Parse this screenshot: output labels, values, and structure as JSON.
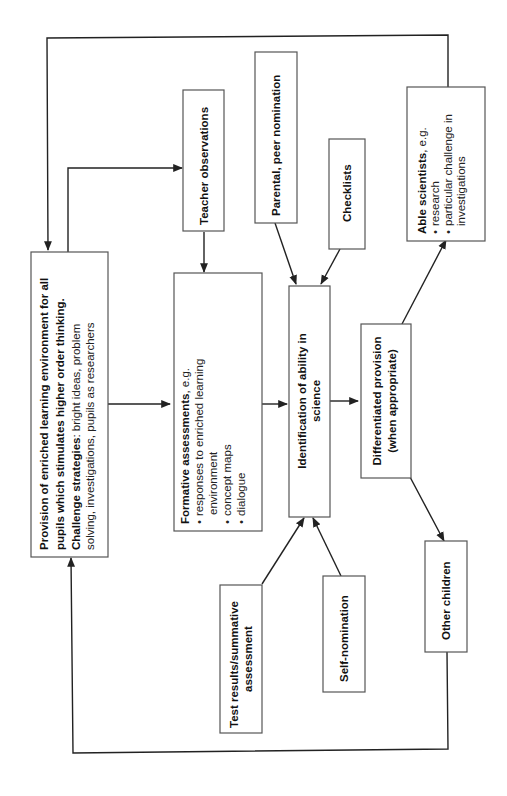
{
  "diagram": {
    "orientation": "rotated-90-ccw",
    "nodes": {
      "provision": {
        "line1": "Provision of enriched learning environment for all",
        "line2": "pupils which stimulates higher order thinking.",
        "line3_bold": "Challenge strategies",
        "line3_rest": ": bright ideas, problem",
        "line4": "solving, investigations, pupils as researchers"
      },
      "teacher_observations": {
        "label": "Teacher observations"
      },
      "formative": {
        "title_bold": "Formative assessments",
        "title_rest": ", e.g.",
        "bullets": [
          "responses to enriched learning",
          "environment",
          "concept maps",
          "dialogue"
        ]
      },
      "parental": {
        "label": "Parental, peer nomination"
      },
      "checklists": {
        "label": "Checklists"
      },
      "identification": {
        "line1": "Identification of ability in",
        "line2": "science"
      },
      "test_results": {
        "line1": "Test results/summative",
        "line2": "assessment"
      },
      "self_nomination": {
        "label": "Self-nomination"
      },
      "differentiated": {
        "line1": "Differentiated provision",
        "line2": "(when appropriate)"
      },
      "able_scientists": {
        "title_bold": "Able scientists",
        "title_rest": ", e.g.",
        "bullets": [
          "research",
          "particular challenge in",
          "investigations"
        ]
      },
      "other_children": {
        "label": "Other children"
      }
    },
    "bullet_glyph": "•",
    "colors": {
      "line": "#222222",
      "box_border": "#555555",
      "background": "#ffffff"
    }
  }
}
